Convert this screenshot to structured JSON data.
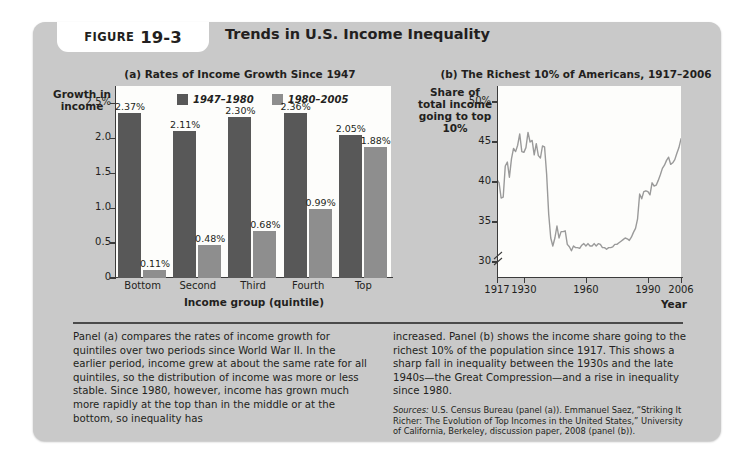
{
  "figure": {
    "tab_label": "FIGURE",
    "tab_number": "19-3",
    "title": "Trends in U.S. Income Inequality"
  },
  "chart_data": [
    {
      "type": "bar",
      "title": "(a) Rates of Income Growth Since 1947",
      "xlabel": "Income group (quintile)",
      "ylabel": "Growth in income",
      "categories": [
        "Bottom",
        "Second",
        "Third",
        "Fourth",
        "Top"
      ],
      "series": [
        {
          "name": "1947–1980",
          "color": "#585858",
          "values": [
            2.37,
            2.11,
            2.3,
            2.36,
            2.05
          ],
          "labels": [
            "2.37%",
            "2.11%",
            "2.30%",
            "2.36%",
            "2.05%"
          ]
        },
        {
          "name": "1980–2005",
          "color": "#8e8e8e",
          "values": [
            0.11,
            0.48,
            0.68,
            0.99,
            1.88
          ],
          "labels": [
            "0.11%",
            "0.48%",
            "0.68%",
            "0.99%",
            "1.88%"
          ]
        }
      ],
      "yticks": [
        "0",
        "0.5",
        "1.0",
        "1.5",
        "2.0",
        "2.5%"
      ],
      "ytick_values": [
        0,
        0.5,
        1.0,
        1.5,
        2.0,
        2.5
      ],
      "ylim": [
        0,
        2.75
      ],
      "grid": false,
      "legend_position": "top-center"
    },
    {
      "type": "line",
      "title": "(b) The Richest 10% of Americans, 1917–2006",
      "xlabel": "Year",
      "ylabel": "Share of total income going to top 10%",
      "yticks": [
        "30",
        "35",
        "40",
        "45",
        "50%"
      ],
      "ytick_values": [
        30,
        35,
        40,
        45,
        50
      ],
      "ylim": [
        28,
        52
      ],
      "axis_break": true,
      "xticks": [
        "1917",
        "1930",
        "1960",
        "1990",
        "2006"
      ],
      "xtick_values": [
        1917,
        1930,
        1960,
        1990,
        2006
      ],
      "xlim": [
        1917,
        2006
      ],
      "line_color": "#9a9a9a",
      "grid": false,
      "x": [
        1917,
        1918,
        1919,
        1920,
        1921,
        1922,
        1923,
        1924,
        1925,
        1926,
        1927,
        1928,
        1929,
        1930,
        1931,
        1932,
        1933,
        1934,
        1935,
        1936,
        1937,
        1938,
        1939,
        1940,
        1941,
        1942,
        1943,
        1944,
        1945,
        1946,
        1947,
        1948,
        1949,
        1950,
        1951,
        1952,
        1953,
        1954,
        1955,
        1956,
        1957,
        1958,
        1959,
        1960,
        1961,
        1962,
        1963,
        1964,
        1965,
        1966,
        1967,
        1968,
        1969,
        1970,
        1971,
        1972,
        1973,
        1974,
        1975,
        1976,
        1977,
        1978,
        1979,
        1980,
        1981,
        1982,
        1983,
        1984,
        1985,
        1986,
        1987,
        1988,
        1989,
        1990,
        1991,
        1992,
        1993,
        1994,
        1995,
        1996,
        1997,
        1998,
        1999,
        2000,
        2001,
        2002,
        2003,
        2004,
        2005,
        2006
      ],
      "y": [
        40.3,
        39.9,
        38.0,
        38.1,
        42.0,
        42.5,
        40.6,
        42.9,
        44.2,
        43.8,
        44.6,
        46.0,
        43.8,
        43.7,
        44.3,
        46.2,
        45.0,
        45.2,
        43.4,
        44.8,
        43.3,
        43.0,
        44.5,
        44.4,
        41.0,
        36.0,
        33.0,
        32.0,
        33.0,
        34.5,
        33.0,
        33.8,
        33.8,
        33.9,
        32.2,
        31.9,
        31.4,
        32.0,
        31.8,
        31.8,
        31.7,
        32.1,
        32.3,
        32.0,
        32.3,
        32.0,
        32.0,
        32.3,
        32.0,
        32.3,
        32.2,
        31.8,
        31.8,
        31.6,
        31.8,
        31.8,
        31.9,
        32.2,
        32.2,
        32.4,
        32.6,
        32.8,
        33.0,
        32.9,
        32.7,
        33.1,
        33.7,
        34.2,
        35.4,
        38.5,
        37.9,
        38.8,
        38.9,
        38.8,
        38.4,
        39.9,
        39.5,
        39.6,
        40.2,
        40.9,
        41.7,
        42.1,
        42.7,
        43.1,
        42.2,
        42.4,
        42.8,
        43.6,
        44.3,
        45.4
      ]
    }
  ],
  "caption": {
    "left": "Panel (a) compares the rates of income growth for quintiles over two periods since World War II. In the earlier period, income grew at about the same rate for all quintiles, so the distribution of income was more or less stable. Since 1980, however, income has grown much more rapidly at the top than in the middle or at the bottom, so inequality has",
    "right": "increased. Panel (b) shows the income share going to the richest 10% of the population since 1917. This shows a sharp fall in inequality between the 1930s and the late 1940s—the Great Compression—and a rise in inequality since 1980.",
    "sources_label": "Sources:",
    "sources_text": " U.S. Census Bureau (panel (a)). Emmanuel Saez, “Striking It Richer: The Evolution of Top Incomes in the United States,” University of California, Berkeley, discussion paper, 2008 (panel (b))."
  }
}
